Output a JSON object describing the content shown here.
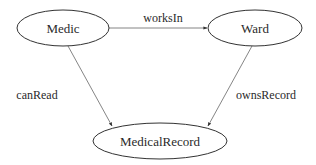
{
  "diagram": {
    "type": "entity-relationship graph",
    "nodes": [
      {
        "id": "medic",
        "label": "Medic",
        "cx": 63,
        "cy": 28,
        "rx": 46,
        "ry": 18
      },
      {
        "id": "ward",
        "label": "Ward",
        "cx": 255,
        "cy": 28,
        "rx": 47,
        "ry": 18
      },
      {
        "id": "medicalrecord",
        "label": "MedicalRecord",
        "cx": 160,
        "cy": 141,
        "rx": 67,
        "ry": 18
      }
    ],
    "edges": [
      {
        "id": "worksIn",
        "from": "medic",
        "to": "ward",
        "label": "worksIn",
        "x1": 109,
        "y1": 28,
        "x2": 207,
        "y2": 28,
        "lx": 163,
        "ly": 22
      },
      {
        "id": "canRead",
        "from": "medic",
        "to": "medicalrecord",
        "label": "canRead",
        "x1": 68,
        "y1": 46,
        "x2": 112,
        "y2": 126,
        "lx": 37,
        "ly": 99
      },
      {
        "id": "ownsRecord",
        "from": "ward",
        "to": "medicalrecord",
        "label": "ownsRecord",
        "x1": 252,
        "y1": 46,
        "x2": 208,
        "y2": 126,
        "lx": 266,
        "ly": 99
      }
    ],
    "colors": {
      "node_stroke": "#333333",
      "edge_stroke": "#666666",
      "text": "#2a2a2a",
      "background": "#ffffff"
    }
  }
}
